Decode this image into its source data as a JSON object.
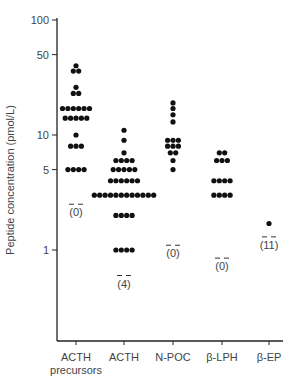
{
  "chart_data": {
    "type": "scatter",
    "subtype": "dot-plot",
    "title": "",
    "xlabel": "",
    "ylabel": "Peptide concentration (pmol/L)",
    "yscale": "log",
    "ylim": [
      0.5,
      100
    ],
    "yticks": [
      100,
      50,
      10,
      5,
      1
    ],
    "grid": false,
    "legend": null,
    "categories": [
      "ACTH precursors",
      "ACTH",
      "N-POC",
      "β-LPH",
      "β-EP"
    ],
    "category_lines": [
      [
        "ACTH",
        "precursors"
      ],
      [
        "ACTH"
      ],
      [
        "N-POC"
      ],
      [
        "β-LPH"
      ],
      [
        "β-EP"
      ]
    ],
    "series": [
      {
        "name": "ACTH precursors",
        "rows": [
          {
            "value": 40,
            "count": 1
          },
          {
            "value": 36,
            "count": 2
          },
          {
            "value": 26,
            "count": 1
          },
          {
            "value": 23,
            "count": 2
          },
          {
            "value": 17,
            "count": 6
          },
          {
            "value": 14,
            "count": 5
          },
          {
            "value": 10,
            "count": 1
          },
          {
            "value": 8,
            "count": 3
          },
          {
            "value": 5,
            "count": 4
          }
        ],
        "not_detected": "(0)",
        "detection_limit": 2.5
      },
      {
        "name": "ACTH",
        "rows": [
          {
            "value": 11,
            "count": 1
          },
          {
            "value": 9,
            "count": 1
          },
          {
            "value": 7,
            "count": 1
          },
          {
            "value": 6,
            "count": 4
          },
          {
            "value": 5,
            "count": 5
          },
          {
            "value": 4,
            "count": 6
          },
          {
            "value": 3,
            "count": 12
          },
          {
            "value": 2,
            "count": 4
          },
          {
            "value": 1,
            "count": 4
          }
        ],
        "not_detected": "(4)",
        "detection_limit": 0.6
      },
      {
        "name": "N-POC",
        "rows": [
          {
            "value": 19,
            "count": 1
          },
          {
            "value": 17,
            "count": 1
          },
          {
            "value": 15,
            "count": 1
          },
          {
            "value": 13,
            "count": 1
          },
          {
            "value": 9,
            "count": 3
          },
          {
            "value": 8,
            "count": 3
          },
          {
            "value": 7,
            "count": 2
          },
          {
            "value": 6,
            "count": 1
          },
          {
            "value": 5,
            "count": 1
          }
        ],
        "not_detected": "(0)",
        "detection_limit": 1.1
      },
      {
        "name": "β-LPH",
        "rows": [
          {
            "value": 7,
            "count": 2
          },
          {
            "value": 6,
            "count": 3
          },
          {
            "value": 4,
            "count": 4
          },
          {
            "value": 3,
            "count": 4
          }
        ],
        "not_detected": "(0)",
        "detection_limit": 0.85
      },
      {
        "name": "β-EP",
        "rows": [
          {
            "value": 1.7,
            "count": 1
          }
        ],
        "not_detected": "(11)",
        "detection_limit": 1.3
      }
    ]
  }
}
